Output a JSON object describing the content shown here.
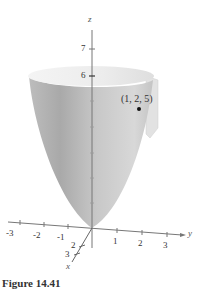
{
  "figure": {
    "caption": "Figure 14.41",
    "surface": "paraboloid",
    "point_label": "(1, 2, 5)",
    "colors": {
      "surface_light": "#e6e6e6",
      "surface_dark": "#9a9a9a",
      "axis": "#666666",
      "point": "#111111",
      "plane": "#dcdcdc"
    }
  },
  "axes": {
    "z": {
      "label": "z",
      "ticks": [
        "7",
        "6"
      ]
    },
    "y": {
      "label": "y",
      "ticks": [
        "-3",
        "-2",
        "-1",
        "1",
        "2",
        "3"
      ]
    },
    "x": {
      "label": "x",
      "ticks": [
        "2",
        "3"
      ]
    }
  }
}
